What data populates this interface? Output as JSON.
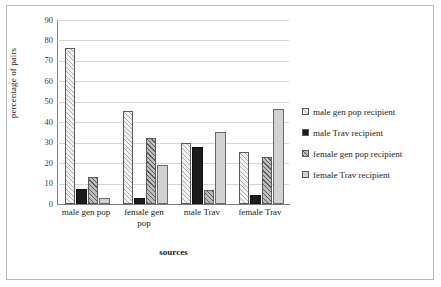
{
  "chart_data": {
    "type": "bar",
    "title": "",
    "xlabel": "sources",
    "ylabel": "percentage of pairs",
    "ylim": [
      0,
      90
    ],
    "y_ticks": [
      0,
      10,
      20,
      30,
      40,
      50,
      60,
      70,
      80,
      90
    ],
    "grid": true,
    "legend_position": "right",
    "categories": [
      "male gen pop",
      "female gen pop",
      "male Trav",
      "female Trav"
    ],
    "series": [
      {
        "name": "male gen pop recipient",
        "values": [
          76.5,
          45.5,
          30.0,
          25.5
        ]
      },
      {
        "name": "male Trav recipient",
        "values": [
          7.5,
          3.0,
          28.0,
          4.5
        ]
      },
      {
        "name": "female gen pop recipient",
        "values": [
          13.0,
          32.5,
          7.0,
          23.0
        ]
      },
      {
        "name": "female Trav recipient",
        "values": [
          3.0,
          19.0,
          35.0,
          46.5
        ]
      }
    ]
  },
  "axes": {
    "y_title": "percentage of pairs",
    "x_title": "sources",
    "y_tick_labels": [
      "90",
      "80",
      "70",
      "60",
      "50",
      "40",
      "30",
      "20",
      "10",
      "0"
    ],
    "x_tick_labels": [
      {
        "line1": "male gen pop",
        "line2": ""
      },
      {
        "line1": "female gen",
        "line2": "pop"
      },
      {
        "line1": "male Trav",
        "line2": ""
      },
      {
        "line1": "female Trav",
        "line2": ""
      }
    ]
  },
  "legend": {
    "items": [
      {
        "label": "male gen pop recipient",
        "swatch": "light-hatch-swatch"
      },
      {
        "label": "male Trav recipient",
        "swatch": "solid-black-swatch"
      },
      {
        "label": "female gen pop recipient",
        "swatch": "grey-hatch-swatch"
      },
      {
        "label": "female Trav recipient",
        "swatch": "light-grey-swatch"
      }
    ]
  },
  "colors": {
    "series_0": "#f2f2f2",
    "series_1": "#1c1c1c",
    "series_2": "#bdbdbd",
    "series_3": "#d2d2d2",
    "gridline": "#d6d6d6",
    "axis": "#7d7d7d",
    "frame": "#b9b9b9"
  }
}
